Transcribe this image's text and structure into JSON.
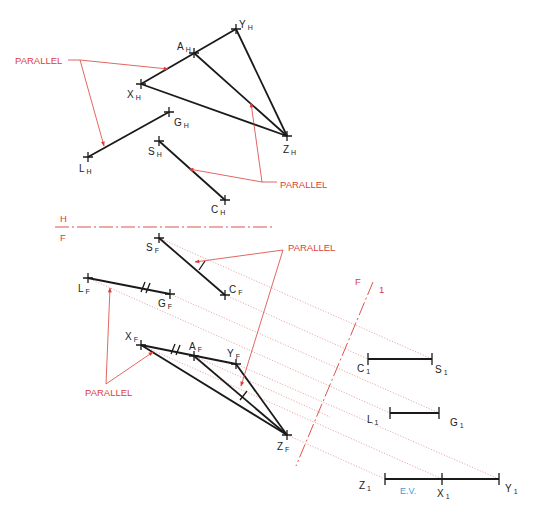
{
  "labels": {
    "parallel_1": "PARALLEL",
    "parallel_2": "PARALLEL",
    "parallel_3": "PARALLEL",
    "parallel_4": "PARALLEL",
    "fold_hf_top": "H",
    "fold_hf_bottom": "F",
    "fold_f1_left": "F",
    "fold_f1_right": "1",
    "true_length": "E.V."
  },
  "points": {
    "horizontal_view": {
      "X": {
        "letter": "X",
        "sub": "H"
      },
      "A": {
        "letter": "A",
        "sub": "H"
      },
      "Y": {
        "letter": "Y",
        "sub": "H"
      },
      "Z": {
        "letter": "Z",
        "sub": "H"
      },
      "G": {
        "letter": "G",
        "sub": "H"
      },
      "L": {
        "letter": "L",
        "sub": "H"
      },
      "S": {
        "letter": "S",
        "sub": "H"
      },
      "C": {
        "letter": "C",
        "sub": "H"
      }
    },
    "front_view": {
      "S": {
        "letter": "S",
        "sub": "F"
      },
      "C": {
        "letter": "C",
        "sub": "F"
      },
      "L": {
        "letter": "L",
        "sub": "F"
      },
      "G": {
        "letter": "G",
        "sub": "F"
      },
      "X": {
        "letter": "X",
        "sub": "F"
      },
      "A": {
        "letter": "A",
        "sub": "F"
      },
      "Y": {
        "letter": "Y",
        "sub": "F"
      },
      "Z": {
        "letter": "Z",
        "sub": "F"
      }
    },
    "auxiliary_view": {
      "C": {
        "letter": "C",
        "sub": "1"
      },
      "S": {
        "letter": "S",
        "sub": "1"
      },
      "L": {
        "letter": "L",
        "sub": "1"
      },
      "G": {
        "letter": "G",
        "sub": "1"
      },
      "Z": {
        "letter": "Z",
        "sub": "1"
      },
      "X": {
        "letter": "X",
        "sub": "1"
      },
      "Y": {
        "letter": "Y",
        "sub": "1"
      }
    }
  },
  "colors": {
    "annotation": "#d9403a",
    "projection": "#e4a3a0",
    "true_length": "#4a9bd1",
    "geometry": "#1a1a1a"
  }
}
